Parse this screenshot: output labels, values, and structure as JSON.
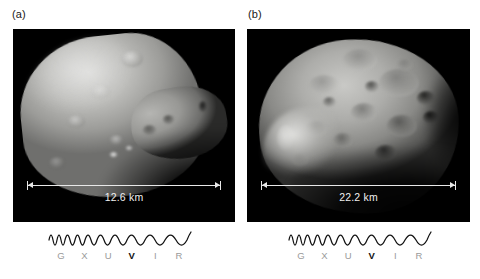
{
  "figure": {
    "panels": [
      {
        "label": "(a)",
        "subject": "deimos",
        "scale_text": "12.6 km",
        "spectrum": {
          "letters": [
            "G",
            "X",
            "U",
            "V",
            "I",
            "R"
          ],
          "highlighted": "V"
        }
      },
      {
        "label": "(b)",
        "subject": "phobos",
        "scale_text": "22.2 km",
        "spectrum": {
          "letters": [
            "G",
            "X",
            "U",
            "V",
            "I",
            "R"
          ],
          "highlighted": "V"
        }
      }
    ],
    "colors": {
      "background": "#ffffff",
      "panel_background": "#000000",
      "scale_line": "#e8e8e8",
      "scale_text": "#f0f0f0",
      "letter_inactive": "#9a9a9a",
      "letter_active": "#111111"
    }
  }
}
